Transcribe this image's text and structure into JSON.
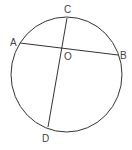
{
  "diagram": {
    "type": "circle-with-chords",
    "stroke_color": "#333333",
    "label_color": "#444444",
    "circle": {
      "cx": 66.5,
      "cy": 74.5,
      "rx": 55.5,
      "ry": 57.5
    },
    "chords": [
      {
        "name": "AB",
        "from": "A",
        "to": "B"
      },
      {
        "name": "CD",
        "from": "C",
        "to": "D"
      }
    ],
    "points": {
      "A": {
        "label": "A",
        "x": 20,
        "y": 43,
        "label_x": 10,
        "label_y": 46
      },
      "B": {
        "label": "B",
        "x": 118,
        "y": 55,
        "label_x": 120,
        "label_y": 59
      },
      "C": {
        "label": "C",
        "x": 67,
        "y": 18,
        "label_x": 64,
        "label_y": 13
      },
      "D": {
        "label": "D",
        "x": 48,
        "y": 127,
        "label_x": 42,
        "label_y": 142
      },
      "O": {
        "label": "O",
        "x": 62,
        "y": 49,
        "label_x": 64,
        "label_y": 60
      }
    }
  }
}
